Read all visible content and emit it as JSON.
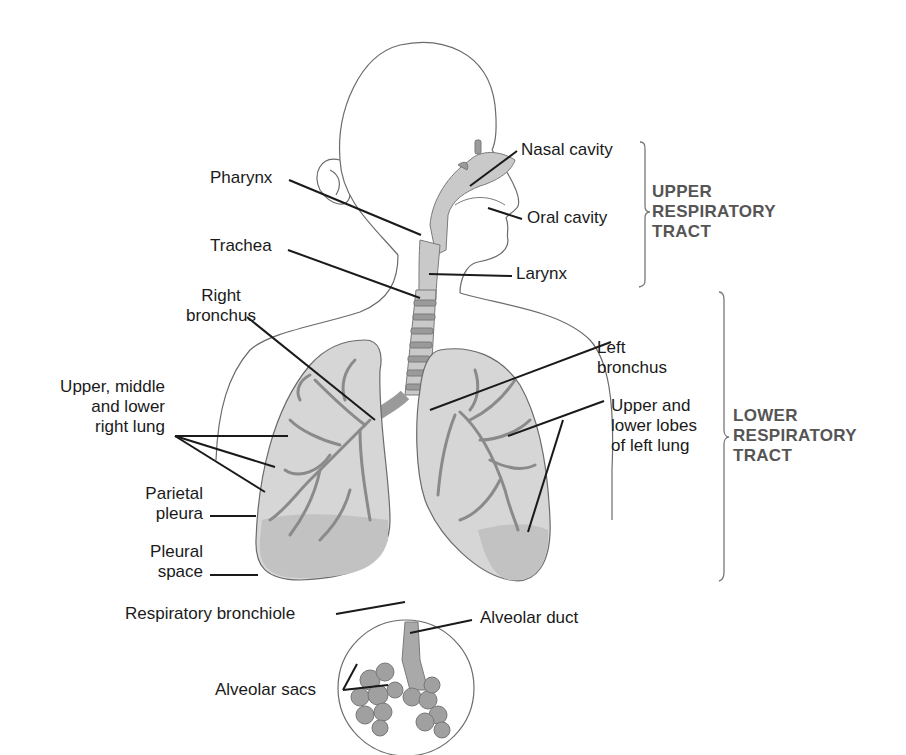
{
  "figure": {
    "colors": {
      "outline": "#6b6b6b",
      "tissue_fill": "#c9c9c9",
      "tissue_dark": "#9a9a9a",
      "leader_line": "#1a1a1a",
      "region_label": "#555555",
      "label_text": "#1a1a1a"
    }
  },
  "labels": {
    "nasal_cavity": "Nasal cavity",
    "pharynx": "Pharynx",
    "oral_cavity": "Oral cavity",
    "trachea": "Trachea",
    "larynx": "Larynx",
    "right_bronchus": [
      "Right",
      "bronchus"
    ],
    "left_bronchus": [
      "Left",
      "bronchus"
    ],
    "right_lung": [
      "Upper, middle",
      "and lower",
      "right lung"
    ],
    "left_lung": [
      "Upper and",
      "lower lobes",
      "of left lung"
    ],
    "parietal_pleura": [
      "Parietal",
      "pleura"
    ],
    "pleural_space": [
      "Pleural",
      "space"
    ],
    "respiratory_bronchiole": "Respiratory bronchiole",
    "alveolar_duct": "Alveolar duct",
    "alveolar_sacs": "Alveolar sacs"
  },
  "regions": {
    "upper": [
      "UPPER",
      "RESPIRATORY",
      "TRACT"
    ],
    "lower": [
      "LOWER",
      "RESPIRATORY",
      "TRACT"
    ]
  }
}
